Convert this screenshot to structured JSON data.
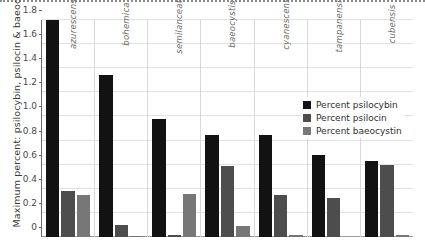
{
  "chart_data": {
    "type": "bar",
    "title": "",
    "xlabel": "",
    "ylabel": "Maximum percent: psilocybin, psilocin & baeocystin",
    "ylim": [
      0,
      1.8
    ],
    "yticks": [
      "0",
      "0.2",
      "0.4",
      "0.6",
      "0.8",
      "1.0",
      "1.2",
      "1.4",
      "1.6",
      "1.8"
    ],
    "ytick_values": [
      0,
      0.2,
      0.4,
      0.6,
      0.8,
      1.0,
      1.2,
      1.4,
      1.6,
      1.8
    ],
    "grid": "horizontal-and-group-dividers",
    "legend_position": "inside-right",
    "categories": [
      "azurescens",
      "bohemica",
      "semilanceata",
      "baeocystis",
      "cyanescens",
      "tampanensis",
      "cubensis"
    ],
    "series": [
      {
        "name": "Percent psilocybin",
        "color": "#121212",
        "values": [
          1.8,
          1.34,
          0.98,
          0.85,
          0.85,
          0.68,
          0.63
        ]
      },
      {
        "name": "Percent psilocin",
        "color": "#4d4d4d",
        "values": [
          0.38,
          0.1,
          0.02,
          0.59,
          0.35,
          0.32,
          0.6
        ]
      },
      {
        "name": "Percent baeocystin",
        "color": "#777777",
        "values": [
          0.35,
          0.01,
          0.36,
          0.09,
          0.02,
          0.0,
          0.015
        ]
      }
    ]
  },
  "legend": {
    "items": [
      {
        "label": "Percent psilocybin"
      },
      {
        "label": "Percent psilocin"
      },
      {
        "label": "Percent baeocystin"
      }
    ]
  }
}
